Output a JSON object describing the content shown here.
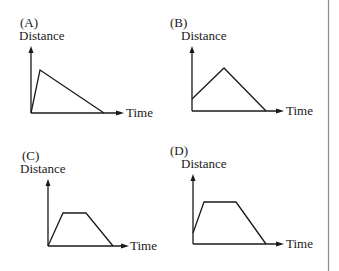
{
  "figure": {
    "type": "multiple-choice distance-time graphs",
    "divider_color": "#8a8a8a",
    "ink_color": "#1a1a1a"
  },
  "graphs": [
    {
      "label": "(A)",
      "y_axis_label": "Distance",
      "x_axis_label": "Time",
      "shape": "rises steeply from origin to a peak, then declines linearly to zero",
      "points": [
        [
          0,
          0
        ],
        [
          0.1,
          0.65
        ],
        [
          0.8,
          0
        ]
      ]
    },
    {
      "label": "(B)",
      "y_axis_label": "Distance",
      "x_axis_label": "Time",
      "shape": "starts above zero, rises linearly to a peak, then declines linearly to zero",
      "points": [
        [
          0,
          0.2
        ],
        [
          0.35,
          0.7
        ],
        [
          0.8,
          0
        ]
      ]
    },
    {
      "label": "(C)",
      "y_axis_label": "Distance",
      "x_axis_label": "Time",
      "shape": "rises from origin, flat plateau, then declines to zero",
      "points": [
        [
          0,
          0
        ],
        [
          0.2,
          0.5
        ],
        [
          0.5,
          0.5
        ],
        [
          0.85,
          0
        ]
      ]
    },
    {
      "label": "(D)",
      "y_axis_label": "Distance",
      "x_axis_label": "Time",
      "shape": "starts above zero, rises to a flat plateau, then declines to zero",
      "points": [
        [
          0,
          0.17
        ],
        [
          0.12,
          0.65
        ],
        [
          0.47,
          0.65
        ],
        [
          0.8,
          0
        ]
      ]
    }
  ]
}
